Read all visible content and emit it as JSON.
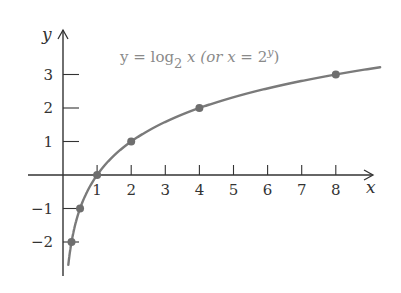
{
  "chart_data": {
    "type": "line",
    "title_parts": {
      "lhs": "y = log",
      "base": "2",
      "arg": " x (or ",
      "x": "x",
      "eq": " = 2",
      "exp": "y",
      "close": ")"
    },
    "xlabel": "x",
    "ylabel": "y",
    "xlim": [
      -1,
      8.9
    ],
    "ylim": [
      -3,
      4.3
    ],
    "x_ticks": [
      1,
      2,
      3,
      4,
      5,
      6,
      7,
      8
    ],
    "y_ticks": [
      -2,
      -1,
      1,
      2,
      3
    ],
    "grid": false,
    "series": [
      {
        "name": "y = log2 x",
        "function": "log2(x)",
        "points": [
          {
            "x": 0.25,
            "y": -2
          },
          {
            "x": 0.5,
            "y": -1
          },
          {
            "x": 1,
            "y": 0
          },
          {
            "x": 2,
            "y": 1
          },
          {
            "x": 4,
            "y": 2
          },
          {
            "x": 8,
            "y": 3
          }
        ]
      }
    ],
    "colors": {
      "axes": "#333333",
      "curve": "#7a7a7a",
      "points": "#6e6e6e",
      "formula": "#8a8a8a"
    }
  }
}
